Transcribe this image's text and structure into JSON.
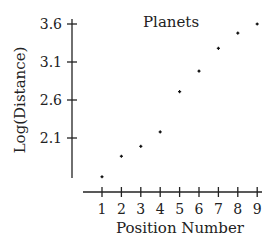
{
  "chart_data": {
    "type": "scatter",
    "title": "Planets",
    "xlabel": "Position Number",
    "ylabel": "Log(Distance)",
    "x": [
      1,
      2,
      3,
      4,
      5,
      6,
      7,
      8,
      9
    ],
    "y": [
      1.59,
      1.86,
      1.99,
      2.18,
      2.71,
      2.98,
      3.28,
      3.48,
      3.6
    ],
    "xticks": [
      1,
      2,
      3,
      4,
      5,
      6,
      7,
      8,
      9
    ],
    "yticks": [
      2.1,
      2.6,
      3.1,
      3.6
    ],
    "ytick_labels": [
      "2.1",
      "2.6",
      "3.1",
      "3.6"
    ],
    "xlim": [
      0.05,
      9.25
    ],
    "ylim": [
      1.37,
      3.65
    ],
    "grid": false,
    "legend": null,
    "marker_color": "#111111",
    "axis_color": "#222222"
  }
}
